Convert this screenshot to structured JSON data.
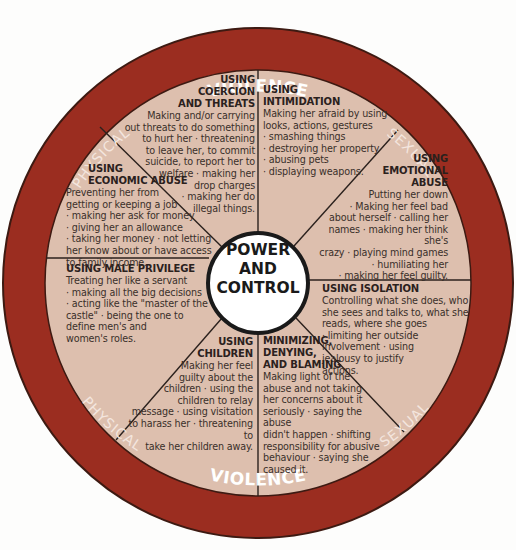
{
  "diagram": {
    "center": {
      "label": "POWER\nAND\nCONTROL"
    },
    "outer_ring": {
      "top": {
        "left": "PHYSICAL",
        "center": "VIOLENCE",
        "right": "SEXUAL"
      },
      "bottom": {
        "left": "PHYSICAL",
        "center": "VIOLENCE",
        "right": "SEXUAL"
      }
    },
    "colors": {
      "ring": "#9b2d20",
      "ring_border": "#3d1a12",
      "segment_fill": "#ddbfae",
      "center_fill": "#ffffff",
      "text": "#3a2f2a",
      "background": "#fdfdfc"
    },
    "segments": [
      {
        "title": "USING\nCOERCION\nAND THREATS",
        "body": "Making and/or carrying\nout threats to do something\nto hurt her · threatening\nto leave her, to commit\nsuicide, to report her to\nwelfare · making her\ndrop charges\n· making her do\nillegal things."
      },
      {
        "title": "USING\nINTIMIDATION",
        "body": "Making her afraid by using\nlooks, actions, gestures\n· smashing things\n· destroying her property\n· abusing pets\n· displaying weapons."
      },
      {
        "title": "USING\nEMOTIONAL\nABUSE",
        "body": "Putting her down\n· Making her feel bad\nabout herself · calling her\nnames · making her think she's\ncrazy · playing mind games\n· humiliating her\n· making her feel guilty."
      },
      {
        "title": "USING ISOLATION",
        "body": "Controlling what she does, who\nshe sees and talks to, what she\nreads, where she goes\n· limiting her outside\n    involvement · using\n      jealousy to justify\n        actions."
      },
      {
        "title": "MINIMIZING,\nDENYING,\nAND BLAMING",
        "body": "Making light of the\nabuse and not taking\nher concerns about it\nseriously · saying the abuse\ndidn't happen · shifting\nresponsibility for abusive\nbehaviour · saying she\ncaused it."
      },
      {
        "title": "USING\nCHILDREN",
        "body": "Making her feel\nguilty about the\nchildren · using the\nchildren to relay\nmessage · using visitation\nto harass her · threatening to\ntake her children away."
      },
      {
        "title": "USING MALE PRIVILEGE",
        "body": "Treating her like a servant\n · making all the big decisions\n  · acting like the \"master of the\n   castle\" · being the one to\n    define men's and\n     women's roles."
      },
      {
        "title": "USING\nECONOMIC ABUSE",
        "body": "  Preventing her from\ngetting or keeping a job\n · making her ask for money\n· giving her an allowance\n· taking  her money · not letting\nher know about or have access\nto family income."
      }
    ]
  }
}
